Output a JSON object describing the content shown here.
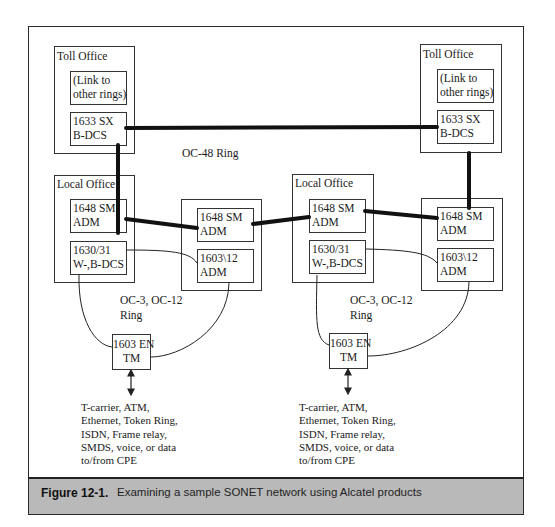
{
  "figure": {
    "caption_label": "Figure 12-1.",
    "caption_text": "Examining a sample SONET network using Alcatel products",
    "caption_bar_color": "#b9b9b9"
  },
  "diagram": {
    "toll_office_left": {
      "title": "Toll Office",
      "link_box": "(Link to\nother rings)",
      "dcs_box": "1633 SX\nB-DCS"
    },
    "toll_office_right": {
      "title": "Toll Office",
      "link_box": "(Link to\nother rings)",
      "dcs_box": "1633 SX\nB-DCS"
    },
    "oc48_ring_label": "OC-48 Ring",
    "local_office_left": {
      "title": "Local Office",
      "adm_box": "1648 SM\nADM",
      "dcs_box": "1630/31\nW-,B-DCS"
    },
    "site_left": {
      "adm_box": "1648 SM\nADM",
      "adm2_box": "1603\\12\nADM"
    },
    "local_office_right": {
      "title": "Local Office",
      "adm_box": "1648 SM\nADM",
      "dcs_box": "1630/31\nW-,B-DCS"
    },
    "site_right": {
      "adm_box": "1648 SM\nADM",
      "adm2_box": "1603\\12\nADM"
    },
    "oc3_ring_left_label": "OC-3, OC-12\nRing",
    "oc3_ring_right_label": "OC-3, OC-12\nRing",
    "tm_left": "1603 EN\nTM",
    "tm_right": "1603 EN\nTM",
    "cpe_left": "T-carrier, ATM,\nEthernet, Token Ring,\nISDN, Frame relay,\nSMDS, voice, or data\nto/from CPE",
    "cpe_right": "T-carrier, ATM,\nEthernet, Token Ring,\nISDN, Frame relay,\nSMDS, voice, or data\nto/from CPE"
  }
}
